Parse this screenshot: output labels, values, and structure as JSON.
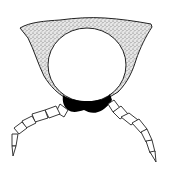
{
  "figure": {
    "parts": {
      "outer_body": {
        "fill": "#d9d9d9",
        "stroke": "#222222",
        "texture": "stipple"
      },
      "inner_cavity": {
        "fill": "#ffffff",
        "stroke": "#222222"
      },
      "ventral_plate": {
        "fill": "#000000"
      },
      "left_leg": {
        "segments": 6,
        "fill": "#ffffff",
        "stroke": "#222222"
      },
      "right_leg": {
        "segments": 6,
        "fill": "#ffffff",
        "stroke": "#222222"
      }
    },
    "colors": {
      "background": "#ffffff",
      "ink": "#222222",
      "stipple": "#d9d9d9",
      "solid": "#000000"
    }
  }
}
